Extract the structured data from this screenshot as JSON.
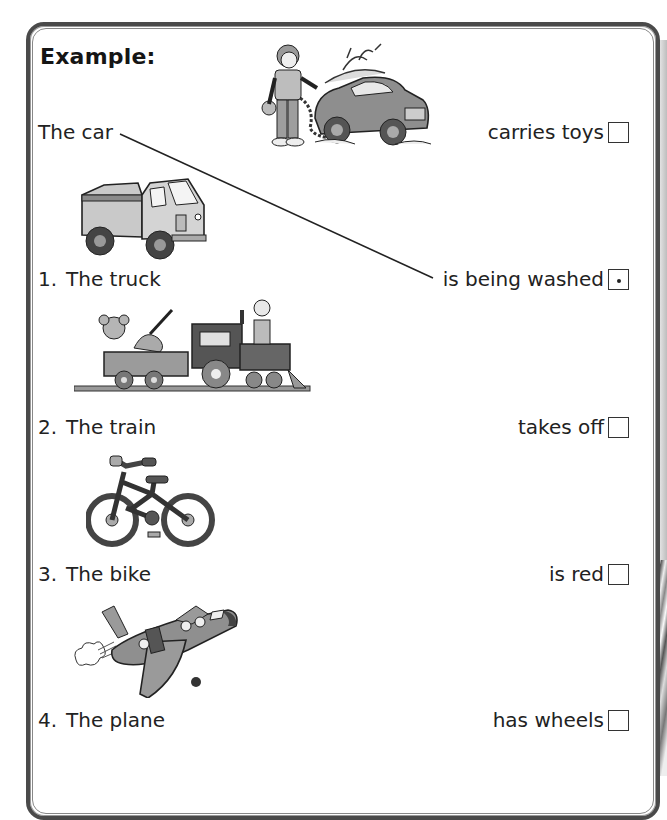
{
  "worksheet": {
    "heading": "Example:",
    "example": {
      "subject": "The car",
      "image": "boy-washing-car-illustration"
    },
    "items": [
      {
        "number": "1.",
        "subject": "The truck",
        "image": "truck-illustration"
      },
      {
        "number": "2.",
        "subject": "The train",
        "image": "toy-train-illustration"
      },
      {
        "number": "3.",
        "subject": "The bike",
        "image": "bicycle-illustration"
      },
      {
        "number": "4.",
        "subject": "The plane",
        "image": "airplane-illustration"
      }
    ],
    "choices": [
      {
        "label": "carries toys",
        "checked": false
      },
      {
        "label": "is being washed",
        "checked": true,
        "mark": "dot"
      },
      {
        "label": "takes off",
        "checked": false
      },
      {
        "label": "is red",
        "checked": false
      },
      {
        "label": "has wheels",
        "checked": false
      }
    ],
    "example_connection": {
      "from": "The car",
      "to": "is being washed"
    }
  }
}
